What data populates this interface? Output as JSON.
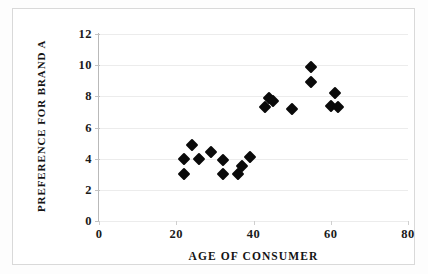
{
  "chart_data": {
    "type": "scatter",
    "title": "",
    "xlabel": "AGE OF CONSUMER",
    "ylabel": "PREFERENCE FOR BRAND A",
    "xlim": [
      0,
      80
    ],
    "ylim": [
      0,
      12
    ],
    "xticks": [
      0,
      20,
      40,
      60,
      80
    ],
    "yticks": [
      0,
      2,
      4,
      6,
      8,
      10,
      12
    ],
    "xtick_labels": [
      "0",
      "20",
      "40",
      "60",
      "80"
    ],
    "ytick_labels": [
      "0",
      "2",
      "4",
      "6",
      "8",
      "10",
      "12"
    ],
    "grid": "horizontal",
    "legend": "none",
    "marker": "filled-diamond",
    "marker_color": "#0a0a0a",
    "series": [
      {
        "name": "Consumers",
        "points": [
          {
            "x": 22,
            "y": 4.0
          },
          {
            "x": 22,
            "y": 3.0
          },
          {
            "x": 24,
            "y": 4.9
          },
          {
            "x": 26,
            "y": 4.0
          },
          {
            "x": 29,
            "y": 4.4
          },
          {
            "x": 32,
            "y": 3.9
          },
          {
            "x": 32,
            "y": 3.0
          },
          {
            "x": 36,
            "y": 3.0
          },
          {
            "x": 37,
            "y": 3.5
          },
          {
            "x": 39,
            "y": 4.1
          },
          {
            "x": 43,
            "y": 7.3
          },
          {
            "x": 44,
            "y": 7.9
          },
          {
            "x": 45,
            "y": 7.7
          },
          {
            "x": 50,
            "y": 7.2
          },
          {
            "x": 55,
            "y": 9.9
          },
          {
            "x": 55,
            "y": 8.9
          },
          {
            "x": 60,
            "y": 7.4
          },
          {
            "x": 61,
            "y": 8.2
          },
          {
            "x": 62,
            "y": 7.3
          }
        ]
      }
    ]
  }
}
